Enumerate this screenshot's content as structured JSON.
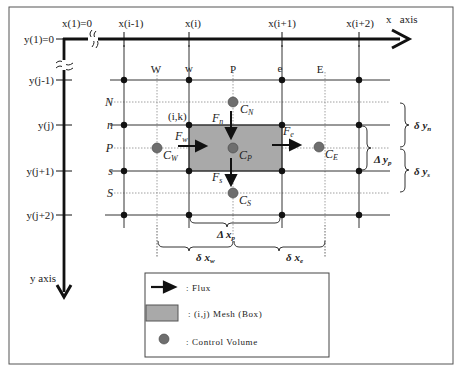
{
  "diagram": {
    "axes": {
      "x_axis_label": "x   axis",
      "y_axis_label": "y axis",
      "x_ticks": [
        "x(1)=0",
        "x(i-1)",
        "x(i)",
        "x(i+1)",
        "x(i+2)"
      ],
      "y_ticks": [
        "y(1)=0",
        "y(j-1)",
        "y(j)",
        "y(j+1)",
        "y(j+2)"
      ]
    },
    "column_labels": {
      "W": "W",
      "w": "w",
      "P": "P",
      "e": "e",
      "E": "E"
    },
    "row_labels": {
      "N": "N",
      "n": "n",
      "P": "P",
      "s": "s",
      "S": "S"
    },
    "cell_label": "(i,k)",
    "control_volumes": {
      "north": "C",
      "north_sub": "N",
      "west": "C",
      "west_sub": "W",
      "center": "C",
      "center_sub": "P",
      "east": "C",
      "east_sub": "E",
      "south": "C",
      "south_sub": "S"
    },
    "fluxes": {
      "north": "F",
      "north_sub": "n",
      "west": "F",
      "west_sub": "w",
      "east": "F",
      "east_sub": "e",
      "south": "F",
      "south_sub": "s"
    },
    "dimensions": {
      "delta_y_n": "δ y",
      "delta_y_n_sub": "n",
      "delta_y_s": "δ y",
      "delta_y_s_sub": "s",
      "Delta_y_p": "Δ y",
      "Delta_y_p_sub": "p",
      "Delta_x_p": "Δ x",
      "Delta_x_p_sub": "p",
      "delta_x_w": "δ x",
      "delta_x_w_sub": "w",
      "delta_x_e": "δ x",
      "delta_x_e_sub": "e"
    },
    "legend": {
      "items": [
        {
          "symbol": "arrow",
          "label": ": Flux"
        },
        {
          "symbol": "box",
          "label": ": (i,j) Mesh (Box)"
        },
        {
          "symbol": "circle",
          "label": ": Control Volume"
        }
      ]
    },
    "colors": {
      "axis": "#111111",
      "grid": "#333333",
      "dotted": "#888888",
      "mesh_fill": "#a9a9a9",
      "control_volume": "#6e6e6e",
      "frame": "#555555"
    }
  }
}
